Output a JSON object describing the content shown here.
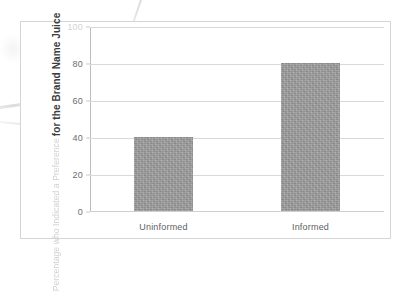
{
  "chart_data": {
    "type": "bar",
    "title": "",
    "xlabel": "",
    "ylabel_line1": "Percentage who Indicated a Preference",
    "ylabel_line2": "for the Brand Name Juice",
    "categories": [
      "Uninformed",
      "Informed"
    ],
    "values": [
      40,
      80
    ],
    "ylim": [
      0,
      100
    ],
    "yticks": [
      0,
      20,
      40,
      60,
      80,
      100
    ],
    "ytick_labels": [
      "0",
      "20",
      "40",
      "60",
      "80",
      "100"
    ],
    "ytick_top_clipped": true,
    "grid": true,
    "legend": "none",
    "bar_color": "#9b9b9b",
    "gridline_color": "#d9d9d9",
    "frame_color": "#d5d5d5",
    "background": "#ffffff"
  }
}
